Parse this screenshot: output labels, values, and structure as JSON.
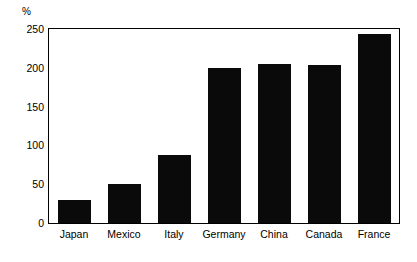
{
  "chart_data": {
    "type": "bar",
    "title": "",
    "subtitle": "",
    "xlabel": "",
    "ylabel": "",
    "unit_label": "%",
    "categories": [
      "Japan",
      "Mexico",
      "Italy",
      "Germany",
      "China",
      "Canada",
      "France"
    ],
    "values": [
      30,
      50,
      88,
      200,
      205,
      204,
      243
    ],
    "series": [
      {
        "name": "",
        "values": [
          30,
          50,
          88,
          200,
          205,
          204,
          243
        ]
      }
    ],
    "ylim": [
      0,
      250
    ],
    "yticks": [
      0,
      50,
      100,
      150,
      200,
      250
    ],
    "ytick_labels": [
      "0",
      "50",
      "100",
      "150",
      "200",
      "250"
    ],
    "grid": false,
    "legend": false,
    "legend_position": "none",
    "bar_color": "#0a0a0a",
    "frame_color": "#000000",
    "background_color": "#ffffff"
  }
}
